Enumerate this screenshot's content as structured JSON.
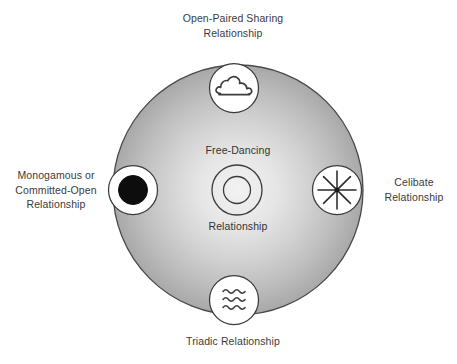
{
  "diagram": {
    "center": {
      "label_top": "Free-Dancing",
      "label_bottom": "Relationship",
      "icon": "concentric-rings-icon"
    },
    "field": {
      "shape": "circle",
      "fill_center_color": "#efefef",
      "fill_edge_color": "#9e9e9e",
      "stroke_color": "#4d4d4d"
    },
    "nodes": [
      {
        "id": "open-paired-sharing",
        "position": "top",
        "label": "Open-Paired Sharing\nRelationship",
        "icon": "cloud-icon",
        "icon_fill": "#ffffff",
        "icon_stroke": "#3b3b3b"
      },
      {
        "id": "monogamous-committed-open",
        "position": "left",
        "label": "Monogamous or\nCommitted-Open\nRelationship",
        "icon": "filled-disc-icon",
        "icon_fill": "#ffffff",
        "icon_stroke": "#3b3b3b",
        "disc_color": "#0d0d0d"
      },
      {
        "id": "celibate",
        "position": "right",
        "label": "Celibate\nRelationship",
        "icon": "asterisk-starburst-icon",
        "icon_fill": "#ffffff",
        "icon_stroke": "#3b3b3b",
        "spokes": 8
      },
      {
        "id": "triadic",
        "position": "bottom",
        "label": "Triadic Relationship",
        "icon": "triple-wave-icon",
        "icon_fill": "#ffffff",
        "icon_stroke": "#3b3b3b",
        "waves": 3
      }
    ]
  }
}
